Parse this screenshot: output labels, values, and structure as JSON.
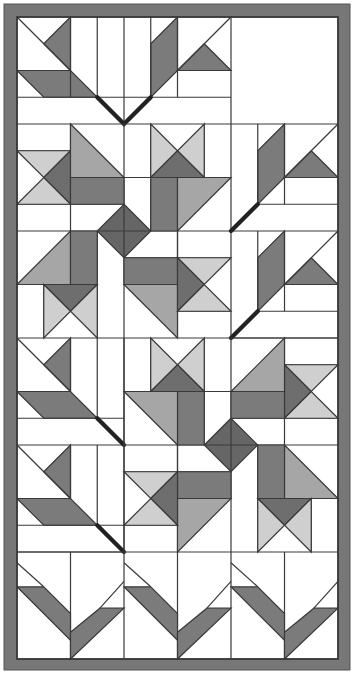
{
  "colors": {
    "background": "#ffffff",
    "border": "#777777",
    "white": "#ffffff",
    "light": "#cfcfcf",
    "medium": "#a6a6a6",
    "dark": "#7b7b7b",
    "darker": "#666666",
    "line": "#3a3a3a"
  },
  "layout": {
    "outer_border_px": [
      4,
      4,
      350,
      670
    ],
    "interior_px": [
      17,
      17,
      338,
      660
    ],
    "grid_units": {
      "cols": 12,
      "rows": 24
    },
    "blocks": {
      "cols": 3,
      "rows": 6,
      "block_units": 4
    }
  },
  "blocks": [
    {
      "row": 1,
      "col": "1-2",
      "type": "maple leaf (top, stem down)"
    },
    {
      "row": 1,
      "col": 3,
      "type": "plain"
    },
    {
      "row": "2-3",
      "col": "1-2",
      "type": "pinwheel with diamond center"
    },
    {
      "row": 2,
      "col": 3,
      "type": "half leaf"
    },
    {
      "row": 3,
      "col": 3,
      "type": "half leaf"
    },
    {
      "row": 4,
      "col": 1,
      "type": "half leaf"
    },
    {
      "row": 5,
      "col": 1,
      "type": "half leaf"
    },
    {
      "row": "4-5",
      "col": "2-3",
      "type": "pinwheel with diamond center (mirrored)"
    },
    {
      "row": 6,
      "col": 1,
      "type": "V leaf"
    },
    {
      "row": 6,
      "col": 2,
      "type": "V leaf"
    },
    {
      "row": 6,
      "col": 3,
      "type": "V leaf"
    }
  ]
}
